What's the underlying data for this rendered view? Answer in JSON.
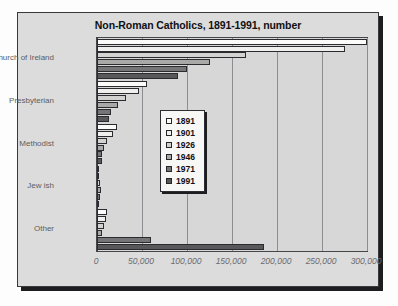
{
  "chart_data": {
    "type": "bar",
    "orientation": "horizontal",
    "title": "Non-Roman Catholics, 1891-1991, number",
    "xlabel": "",
    "ylabel": "",
    "xlim": [
      0,
      300000
    ],
    "grid": true,
    "grid_axis": "x",
    "legend_position": "center-left-inside",
    "categories": [
      "Church of Ireland",
      "Presbyterian",
      "Methodist",
      "Jew ish",
      "Other"
    ],
    "xticks": [
      0,
      50000,
      100000,
      150000,
      200000,
      250000,
      300000
    ],
    "xtick_labels": [
      "0",
      "50,000",
      "100,000",
      "150,000",
      "200,000",
      "250,000",
      "300,000"
    ],
    "series": [
      {
        "name": "1891",
        "color": "#fbfbf9",
        "values": [
          300000,
          56000,
          22000,
          1800,
          11000
        ]
      },
      {
        "name": "1901",
        "color": "#efefed",
        "values": [
          275000,
          47000,
          18000,
          2000,
          10000
        ]
      },
      {
        "name": "1926",
        "color": "#d2d2d0",
        "values": [
          165000,
          32000,
          11000,
          3700,
          8000
        ]
      },
      {
        "name": "1946",
        "color": "#a8a8a6",
        "values": [
          125000,
          23000,
          7500,
          4000,
          5500
        ]
      },
      {
        "name": "1971",
        "color": "#757577",
        "values": [
          100000,
          16000,
          5600,
          3000,
          60000
        ]
      },
      {
        "name": "1991",
        "color": "#58585b",
        "values": [
          90000,
          13000,
          5000,
          1600,
          185000
        ]
      }
    ]
  },
  "legend": {
    "items": [
      {
        "label": "1891"
      },
      {
        "label": "1901"
      },
      {
        "label": "1926"
      },
      {
        "label": "1946"
      },
      {
        "label": "1971"
      },
      {
        "label": "1991"
      }
    ]
  }
}
